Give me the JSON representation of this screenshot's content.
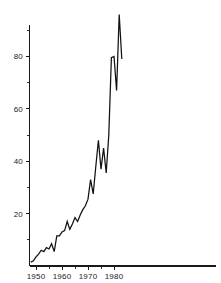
{
  "chart_data": {
    "type": "line",
    "title": "",
    "subtitle": "",
    "xlabel": "",
    "ylabel": "",
    "xlim": [
      1947.5,
      1983.5
    ],
    "ylim": [
      0,
      92
    ],
    "grid": false,
    "legend": null,
    "x_ticks_major": [
      1950,
      1960,
      1970,
      1980
    ],
    "x_tick_labels": [
      "1950",
      "1960",
      "1970",
      "1980"
    ],
    "x_ticks_minor": [
      1955,
      1965,
      1975
    ],
    "y_ticks_major": [
      20,
      40,
      60,
      80
    ],
    "y_tick_labels": [
      "20",
      "40",
      "60",
      "80"
    ],
    "y_ticks_minor": [
      10,
      30,
      50,
      70,
      90
    ],
    "series": [
      {
        "name": "series-1",
        "color": "#111111",
        "x": [
          1948,
          1949,
          1950,
          1951,
          1952,
          1953,
          1954,
          1955,
          1956,
          1957,
          1958,
          1959,
          1960,
          1961,
          1962,
          1963,
          1964,
          1965,
          1966,
          1967,
          1968,
          1969,
          1970,
          1971,
          1972,
          1973,
          1974,
          1975,
          1976,
          1977,
          1978,
          1979,
          1980,
          1981,
          1982,
          1983
        ],
        "values": [
          1.5,
          2.0,
          3.5,
          4.5,
          6.0,
          5.5,
          7.0,
          6.5,
          8.5,
          5.5,
          11.5,
          11.5,
          13.0,
          13.5,
          17.0,
          14.0,
          16.0,
          18.5,
          17.0,
          19.5,
          21.5,
          23.0,
          25.5,
          33.0,
          27.5,
          38.0,
          48.0,
          37.0,
          45.0,
          35.5,
          50.0,
          79.5,
          80.0,
          67.0,
          96.0,
          79.0
        ]
      }
    ]
  },
  "axes": {
    "y_axis_name": "value-axis",
    "x_axis_name": "year-axis"
  }
}
